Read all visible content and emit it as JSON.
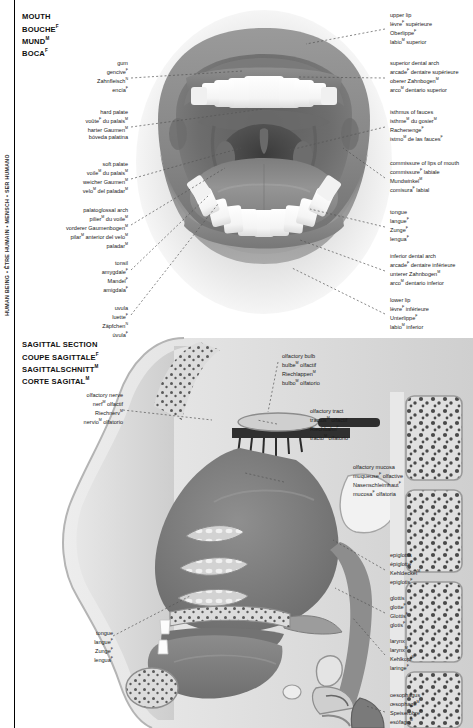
{
  "sidebar": {
    "vertical_label": "HUMAN BEING • ÊTRE HUMAIN • MENSCH • SER HUMANO"
  },
  "sections": [
    {
      "id": "mouth",
      "heading": {
        "en": "MOUTH",
        "fr": "BOUCHE",
        "fr_sup": "F",
        "de": "MUND",
        "de_sup": "M",
        "es": "BOCA",
        "es_sup": "F"
      },
      "labels_left": [
        {
          "name": "gum",
          "en": "gum",
          "fr": "gencive",
          "fr_sup": "F",
          "de": "Zahnfleisch",
          "de_sup": "N",
          "es": "encía",
          "es_sup": "F"
        },
        {
          "name": "hard-palate",
          "en": "hard palate",
          "fr": "voûte",
          "fr_sup": "F",
          "fr_tail": " du palais",
          "fr_tail_sup": "M",
          "de": "harter Gaumen",
          "de_sup": "M",
          "es": "bóveda palatina",
          "es_sup": ""
        },
        {
          "name": "soft-palate",
          "en": "soft palate",
          "fr": "voile",
          "fr_sup": "M",
          "fr_tail": " du palais",
          "fr_tail_sup": "M",
          "de": "weicher Gaumen",
          "de_sup": "M",
          "es": "velo",
          "es_sup": "M",
          "es_tail": " del paladar",
          "es_tail_sup": "M"
        },
        {
          "name": "palatoglossal-arch",
          "en": "palatoglossal arch",
          "fr": "pilier",
          "fr_sup": "M",
          "fr_tail": " du voile",
          "fr_tail_sup": "M",
          "de": "vorderer Gaumenbogen",
          "de_sup": "M",
          "es": "pilar",
          "es_sup": "M",
          "es_tail": " anterior del velo",
          "es_tail_sup": "M",
          "es_line2": "paladar",
          "es_line2_sup": "M"
        },
        {
          "name": "tonsil",
          "en": "tonsil",
          "fr": "amygdale",
          "fr_sup": "F",
          "de": "Mandel",
          "de_sup": "F",
          "es": "amigdala",
          "es_sup": "F"
        },
        {
          "name": "uvula",
          "en": "uvula",
          "fr": "luette",
          "fr_sup": "F",
          "de": "Zäpfchen",
          "de_sup": "N",
          "es": "úvula",
          "es_sup": "F"
        }
      ],
      "labels_right": [
        {
          "name": "upper-lip",
          "en": "upper lip",
          "fr": "lèvre",
          "fr_sup": "F",
          "fr_tail": " supérieure",
          "de": "Oberlippe",
          "de_sup": "F",
          "es": "labio",
          "es_sup": "M",
          "es_tail": " superior"
        },
        {
          "name": "superior-dental-arch",
          "en": "superior dental arch",
          "fr": "arcade",
          "fr_sup": "F",
          "fr_tail": " dentaire supérieure",
          "de": "oberer Zahnbogen",
          "de_sup": "M",
          "es": "arco",
          "es_sup": "M",
          "es_tail": " dentario superior"
        },
        {
          "name": "isthmus-of-fauces",
          "en": "isthmus of fauces",
          "fr": "isthme",
          "fr_sup": "M",
          "fr_tail": " du gosier",
          "fr_tail_sup": "M",
          "de": "Rachenenge",
          "de_sup": "F",
          "es": "istmo",
          "es_sup": "M",
          "es_tail": " de las fauces",
          "es_tail_sup": "F"
        },
        {
          "name": "commissure-of-lips-of-mouth",
          "en": "commissure of lips of mouth",
          "fr": "commissure",
          "fr_sup": "F",
          "fr_tail": " labiale",
          "de": "Mundwinkel",
          "de_sup": "M",
          "es": "comisura",
          "es_sup": "F",
          "es_tail": " labial"
        },
        {
          "name": "tongue",
          "en": "tongue",
          "fr": "langue",
          "fr_sup": "F",
          "de": "Zunge",
          "de_sup": "F",
          "es": "lengua",
          "es_sup": "F"
        },
        {
          "name": "inferior-dental-arch",
          "en": "inferior dental arch",
          "fr": "arcade",
          "fr_sup": "F",
          "fr_tail": " dentaire inférieure",
          "de": "unterer Zahnbogen",
          "de_sup": "M",
          "es": "arco",
          "es_sup": "M",
          "es_tail": " dentario inferior"
        },
        {
          "name": "lower-lip",
          "en": "lower lip",
          "fr": "lèvre",
          "fr_sup": "F",
          "fr_tail": " inférieure",
          "de": "Unterlippe",
          "de_sup": "F",
          "es": "labio",
          "es_sup": "M",
          "es_tail": " inferior"
        }
      ]
    },
    {
      "id": "sagittal",
      "heading": {
        "en": "SAGITTAL SECTION",
        "fr": "COUPE SAGITTALE",
        "fr_sup": "F",
        "de": "SAGITTALSCHNITT",
        "de_sup": "M",
        "es": "CORTE SAGITAL",
        "es_sup": "M"
      },
      "labels_left": [
        {
          "name": "olfactory-nerve",
          "en": "olfactory nerve",
          "fr": "nerf",
          "fr_sup": "M",
          "fr_tail": " olfactif",
          "de": "Riechnerv",
          "de_sup": "M",
          "es": "nervio",
          "es_sup": "M",
          "es_tail": " olfatorio"
        },
        {
          "name": "tongue",
          "en": "tongue",
          "fr": "langue",
          "fr_sup": "F",
          "de": "Zunge",
          "de_sup": "F",
          "es": "lengua",
          "es_sup": "F"
        }
      ],
      "labels_right": [
        {
          "name": "olfactory-bulb",
          "en": "olfactory bulb",
          "fr": "bulbe",
          "fr_sup": "M",
          "fr_tail": " olfactif",
          "de": "Riechlappen",
          "de_sup": "M",
          "es": "bulbo",
          "es_sup": "M",
          "es_tail": " olfatorio"
        },
        {
          "name": "olfactory-tract",
          "en": "olfactory tract",
          "fr": "tractus",
          "fr_sup": "M",
          "fr_tail": " olfactif",
          "de": "Riechbahn",
          "de_sup": "F",
          "es": "tracto",
          "es_sup": "M",
          "es_tail": " olfatorio"
        },
        {
          "name": "olfactory-mucosa",
          "en": "olfactory mucosa",
          "fr": "muqueuse",
          "fr_sup": "F",
          "fr_tail": " olfactive",
          "de": "Nasenschleimhaut",
          "de_sup": "F",
          "es": "mucosa",
          "es_sup": "F",
          "es_tail": " olfatoria"
        },
        {
          "name": "epiglottis",
          "en": "epiglottis",
          "fr": "épiglotte",
          "fr_sup": "F",
          "de": "Kehldeckel",
          "de_sup": "M",
          "es": "epiglotis",
          "es_sup": "F"
        },
        {
          "name": "glottis",
          "en": "glottis",
          "fr": "glotte",
          "fr_sup": "F",
          "de": "Glottis",
          "de_sup": "F",
          "es": "glotis",
          "es_sup": "F"
        },
        {
          "name": "larynx",
          "en": "larynx",
          "fr": "larynx",
          "fr_sup": "M",
          "de": "Kehlkopf",
          "de_sup": "M",
          "es": "laringe",
          "es_sup": "F"
        },
        {
          "name": "oesophagus",
          "en": "oesophagus",
          "fr": "œsophage",
          "fr_sup": "M",
          "de": "Speiseröhre",
          "de_sup": "F",
          "es": "esófago",
          "es_sup": "M"
        }
      ]
    }
  ],
  "colors": {
    "ink": "#1a1a1a",
    "lip": "#8c8c8c",
    "lip_dark": "#6f6f6f",
    "oral_cavity": "#707070",
    "throat_dark": "#4f4f4f",
    "tooth": "#fdfdfd",
    "tongue": "#8a8a8a",
    "bone": "#d9d9d9",
    "tissue": "#9a9a9a",
    "cavity": "#7c7c7c",
    "leader": "#555555"
  }
}
